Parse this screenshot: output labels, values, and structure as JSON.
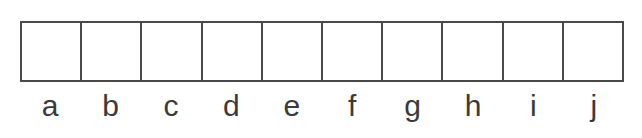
{
  "diagram": {
    "cells": [
      {
        "label": "a"
      },
      {
        "label": "b"
      },
      {
        "label": "c"
      },
      {
        "label": "d"
      },
      {
        "label": "e"
      },
      {
        "label": "f"
      },
      {
        "label": "g"
      },
      {
        "label": "h"
      },
      {
        "label": "i"
      },
      {
        "label": "j"
      }
    ]
  }
}
